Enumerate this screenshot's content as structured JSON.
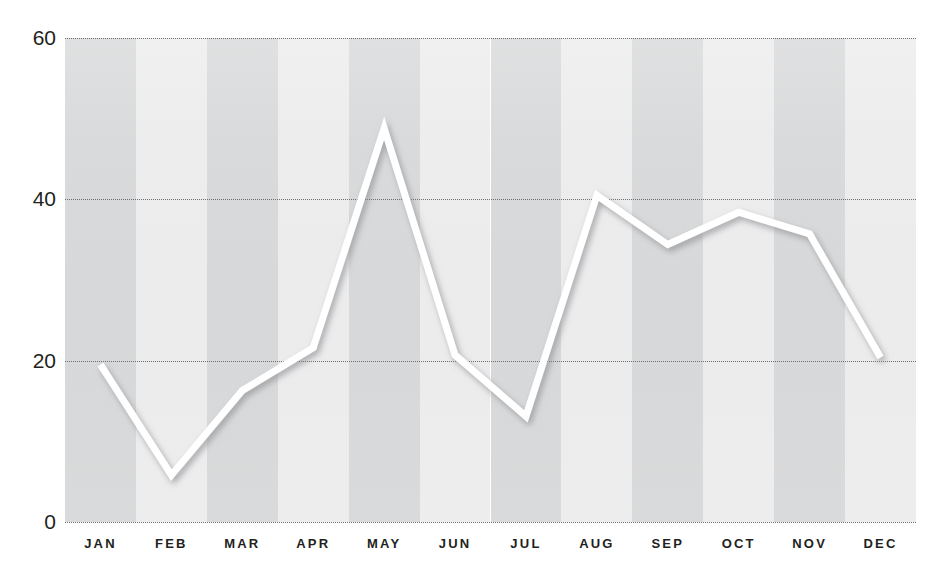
{
  "chart_data": {
    "type": "line",
    "title": "",
    "subtitle": "",
    "xlabel": "",
    "ylabel": "",
    "categories": [
      "JAN",
      "FEB",
      "MAR",
      "APR",
      "MAY",
      "JUN",
      "JUL",
      "AUG",
      "SEP",
      "OCT",
      "NOV",
      "DEC"
    ],
    "series": [
      {
        "name": "",
        "values": [
          19.5,
          5.8,
          16.3,
          21.6,
          48.8,
          20.7,
          13.1,
          40.5,
          34.4,
          38.4,
          35.7,
          20.4
        ]
      }
    ],
    "ylim": [
      0,
      60
    ],
    "yticks": [
      0,
      20,
      40,
      60
    ],
    "ytick_labels": [
      "0",
      "20",
      "40",
      "60"
    ],
    "grid": "horizontal-dotted",
    "legend": "none",
    "line_color": "#ffffff",
    "line_width_px": 7,
    "band_colors": [
      "#d7d8d9",
      "#ececed"
    ],
    "gridline_color": "#6f6f6f",
    "label_color": "#231f20",
    "background": "#ffffff",
    "annotations": []
  },
  "watermark": {
    "line1": "",
    "line2": ""
  }
}
